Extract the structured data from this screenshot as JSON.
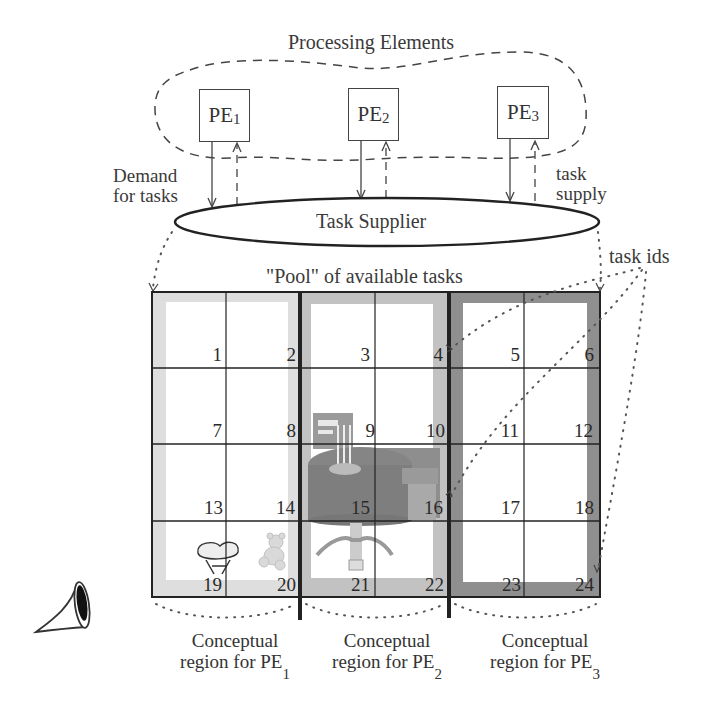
{
  "title": "Processing Elements",
  "processing_elements": [
    {
      "label": "PE",
      "sub": "1",
      "x": 199,
      "y": 89
    },
    {
      "label": "PE",
      "sub": "2",
      "x": 348,
      "y": 88
    },
    {
      "label": "PE",
      "sub": "3",
      "x": 497,
      "y": 87
    }
  ],
  "demand_label": {
    "line1": "Demand",
    "line2": "for tasks"
  },
  "supply_label": {
    "line1": "task",
    "line2": "supply"
  },
  "task_supplier": "Task Supplier",
  "pool_label": "\"Pool\" of available tasks",
  "task_ids_label": "task ids",
  "grid": {
    "cells": [
      "1",
      "2",
      "3",
      "4",
      "5",
      "6",
      "7",
      "8",
      "9",
      "10",
      "11",
      "12",
      "13",
      "14",
      "15",
      "16",
      "17",
      "18",
      "19",
      "20",
      "21",
      "22",
      "23",
      "24"
    ],
    "columns": 6,
    "rows": 4
  },
  "regions": [
    {
      "line1": "Conceptual",
      "line2": "region for PE",
      "sub": "1",
      "shade": "#dcdcdc"
    },
    {
      "line1": "Conceptual",
      "line2": "region for PE",
      "sub": "2",
      "shade": "#bdbdbd"
    },
    {
      "line1": "Conceptual",
      "line2": "region for PE",
      "sub": "3",
      "shade": "#8e8e8e"
    }
  ],
  "icons": [
    "horn-icon",
    "room-scene-image",
    "stool-icon",
    "teddy-bear-icon"
  ]
}
